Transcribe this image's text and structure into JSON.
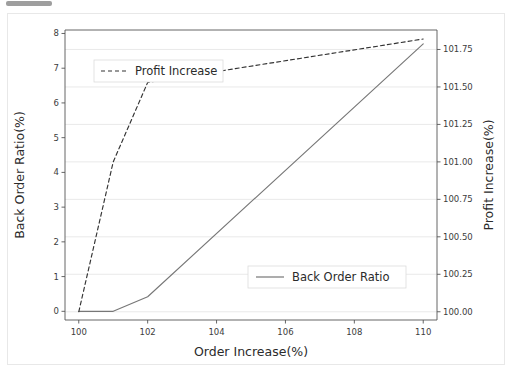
{
  "figure": {
    "background_color": "#ffffff",
    "frame_color": "#e8e8e8",
    "artifact_color": "#8d8d8d"
  },
  "chart_data": {
    "type": "line",
    "title": "",
    "xlabel": "Order Increase(%)",
    "ylabel": "Back Order Ratio(%)",
    "y2label": "Profit Increase(%)",
    "xlim": [
      99.6,
      110.4
    ],
    "ylim": [
      -0.25,
      8.1
    ],
    "y2lim": [
      99.945,
      101.88
    ],
    "xticks": [
      100,
      102,
      104,
      106,
      108,
      110
    ],
    "xticklabels": [
      "100",
      "102",
      "104",
      "106",
      "108",
      "110"
    ],
    "yticks": [
      0,
      1,
      2,
      3,
      4,
      5,
      6,
      7,
      8
    ],
    "yticklabels": [
      "0",
      "1",
      "2",
      "3",
      "4",
      "5",
      "6",
      "7",
      "8"
    ],
    "y2ticks": [
      100.0,
      100.25,
      100.5,
      100.75,
      101.0,
      101.25,
      101.5,
      101.75
    ],
    "y2ticklabels": [
      "100.00",
      "100.25",
      "100.50",
      "100.75",
      "101.00",
      "101.25",
      "101.50",
      "101.75"
    ],
    "grid": true,
    "grid_axis": "y-right",
    "grid_color": "#e6e6e6",
    "legend_position": "two-boxes",
    "series": [
      {
        "name": "Back Order Ratio",
        "axis": "left",
        "style": "solid",
        "color": "#777777",
        "x": [
          100,
          101,
          102,
          110
        ],
        "values": [
          0.0,
          0.0,
          0.42,
          7.7
        ]
      },
      {
        "name": "Profit Increase",
        "axis": "right",
        "style": "dashed",
        "color": "#333333",
        "x": [
          100,
          101,
          102,
          110
        ],
        "values": [
          100.0,
          101.0,
          101.53,
          101.82
        ]
      }
    ]
  },
  "legends": [
    {
      "label": "Profit Increase",
      "style": "dashed",
      "color": "#333333"
    },
    {
      "label": "Back Order Ratio",
      "style": "solid",
      "color": "#777777"
    }
  ]
}
